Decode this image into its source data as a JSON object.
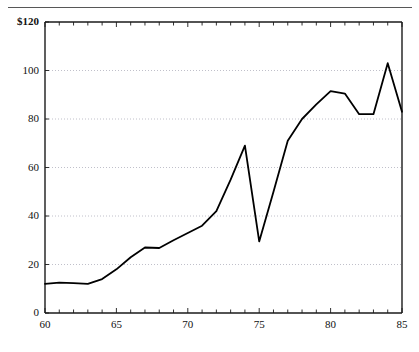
{
  "figure": {
    "name": "line-chart-figure",
    "has_top_rule": true,
    "background_color": "#ffffff"
  },
  "chart_data": {
    "type": "line",
    "title": "",
    "subtitle": "",
    "xlabel": "",
    "ylabel": "",
    "currency_prefix": "$",
    "xlim": [
      60,
      85
    ],
    "ylim": [
      0,
      120
    ],
    "grid": true,
    "grid_axis": "y",
    "legend": false,
    "legend_position": "none",
    "line_color": "#000000",
    "line_width": 1.8,
    "x_tick_labels": [
      "60",
      "65",
      "70",
      "75",
      "80",
      "85"
    ],
    "x_tick_values": [
      60,
      65,
      70,
      75,
      80,
      85
    ],
    "x_minor_tick_step": 1,
    "y_tick_labels": [
      "0",
      "20",
      "40",
      "60",
      "80",
      "100",
      "$120"
    ],
    "y_tick_values": [
      0,
      20,
      40,
      60,
      80,
      100,
      120
    ],
    "x": [
      60,
      61,
      62,
      63,
      64,
      65,
      66,
      67,
      68,
      69,
      70,
      71,
      72,
      73,
      74,
      75,
      76,
      77,
      78,
      79,
      80,
      81,
      82,
      83,
      84,
      85
    ],
    "values": [
      12,
      12.5,
      12.3,
      12,
      14,
      18,
      23,
      27,
      26.8,
      30,
      33,
      36,
      42,
      55,
      69,
      29.5,
      50,
      71,
      80,
      86,
      91.5,
      90.5,
      82,
      82,
      103,
      83
    ],
    "series": [
      {
        "name": "series-1",
        "values": [
          12,
          12.5,
          12.3,
          12,
          14,
          18,
          23,
          27,
          26.8,
          30,
          33,
          36,
          42,
          55,
          69,
          29.5,
          50,
          71,
          80,
          86,
          91.5,
          90.5,
          82,
          82,
          103,
          83
        ]
      }
    ],
    "annotations": []
  },
  "axes": {
    "y_labels": [
      {
        "text": "$120",
        "value": 120
      },
      {
        "text": "100",
        "value": 100
      },
      {
        "text": "80",
        "value": 80
      },
      {
        "text": "60",
        "value": 60
      },
      {
        "text": "40",
        "value": 40
      },
      {
        "text": "20",
        "value": 20
      },
      {
        "text": "0",
        "value": 0
      }
    ],
    "x_labels": [
      {
        "text": "60",
        "value": 60
      },
      {
        "text": "65",
        "value": 65
      },
      {
        "text": "70",
        "value": 70
      },
      {
        "text": "75",
        "value": 75
      },
      {
        "text": "80",
        "value": 80
      },
      {
        "text": "85",
        "value": 85
      }
    ]
  }
}
